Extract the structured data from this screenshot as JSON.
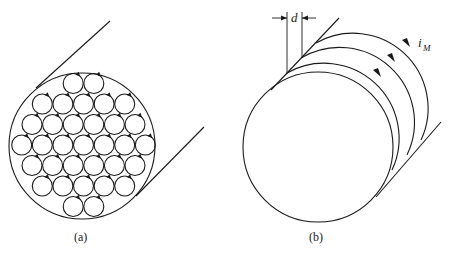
{
  "figure": {
    "panels": [
      {
        "id": "a",
        "caption": "(a)",
        "description": "Cross-section of magnetized cylinder with many small circulating atomic currents",
        "small_loop_rows": [
          2,
          5,
          6,
          7,
          6,
          5,
          2
        ],
        "small_loop_count": 33,
        "loop_direction": "clockwise"
      },
      {
        "id": "b",
        "caption": "(b)",
        "description": "Stacked current loops of thickness d forming surface magnetization current",
        "dimension_label": "d",
        "current_label_main": "i",
        "current_label_sub": "M",
        "loop_count": 4,
        "loop_direction": "clockwise"
      }
    ],
    "colors": {
      "ink": "#1a1a1a",
      "background": "#ffffff"
    }
  }
}
